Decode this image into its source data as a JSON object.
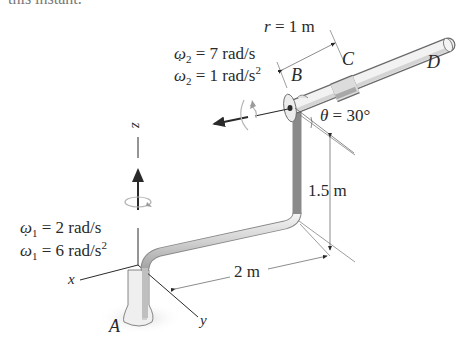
{
  "header": {
    "clipped_text": "this instant."
  },
  "diagram": {
    "points": {
      "A": "A",
      "B": "B",
      "C": "C",
      "D": "D"
    },
    "axes": {
      "x": "x",
      "y": "y",
      "z": "z"
    },
    "omega2": {
      "symbol": "ω",
      "sub": "2",
      "value": " = 7 rad/s"
    },
    "omega2_dot": {
      "symbol": "ω",
      "sub": "2",
      "value": " = 1 rad/s",
      "sup": "2"
    },
    "omega1": {
      "symbol": "ω",
      "sub": "1",
      "value": " = 2 rad/s"
    },
    "omega1_dot": {
      "symbol": "ω",
      "sub": "1",
      "value": " = 6 rad/s",
      "sup": "2"
    },
    "radius": {
      "symbol": "r",
      "value": " = 1 m"
    },
    "theta": {
      "symbol": "θ",
      "value": " = 30°"
    },
    "height_dim": "1.5 m",
    "length_dim": "2 m"
  },
  "colors": {
    "line": "#2a2a2a",
    "rod_light": "#e6e6e6",
    "rod_shade": "#bdbdbd",
    "arrow_gray": "#9a9a9a"
  }
}
